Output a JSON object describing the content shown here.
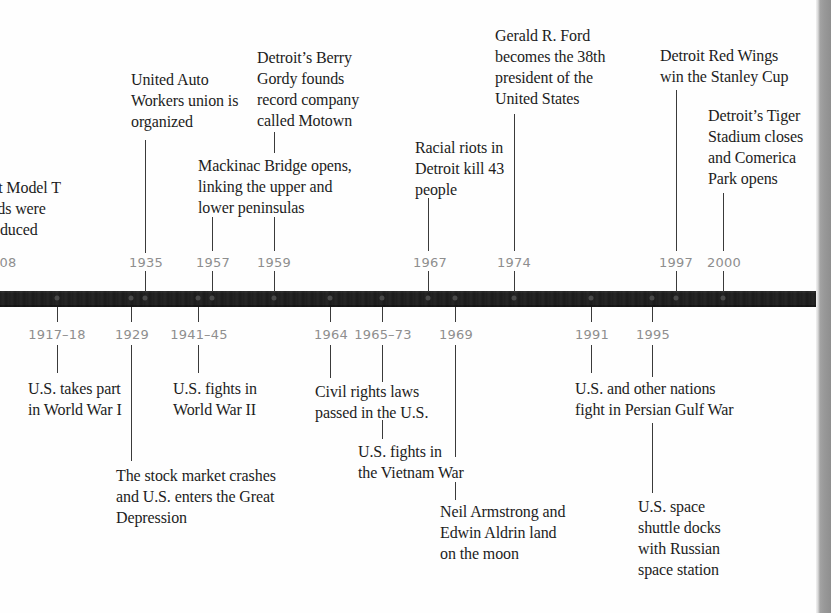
{
  "timeline": {
    "colors": {
      "bar": "#1e1e1e",
      "year_label": "#8e8e8e",
      "event_text": "#1c1c1c",
      "connector": "#3a3a3a",
      "edge_strip": "#999999"
    },
    "above": [
      {
        "year": "1908",
        "year_visible": "08",
        "text": "st Model T\nrds were\noduced",
        "text_full": "First Model T Fords were produced"
      },
      {
        "year": "1935",
        "text": "United Auto\nWorkers union is\norganized"
      },
      {
        "year": "1957",
        "text": "Mackinac Bridge opens,\nlinking the upper and\nlower peninsulas"
      },
      {
        "year": "1959",
        "text": "Detroit’s Berry\nGordy founds\nrecord company\ncalled Motown"
      },
      {
        "year": "1967",
        "text": "Racial riots in\nDetroit kill 43\npeople"
      },
      {
        "year": "1974",
        "text": "Gerald R. Ford\nbecomes the 38th\npresident of the\nUnited States"
      },
      {
        "year": "1997",
        "text": "Detroit Red Wings\nwin the Stanley Cup"
      },
      {
        "year": "2000",
        "text": "Detroit’s Tiger\nStadium closes\nand Comerica\nPark opens"
      }
    ],
    "below": [
      {
        "year": "1917–18",
        "text": "U.S. takes part\nin World War I"
      },
      {
        "year": "1929",
        "text": "The stock market crashes\nand U.S. enters the Great\nDepression"
      },
      {
        "year": "1941–45",
        "text": "U.S. fights in\nWorld War II"
      },
      {
        "year": "1964",
        "text": "Civil rights laws\npassed in the U.S."
      },
      {
        "year": "1965–73",
        "text": "U.S. fights in\nthe Vietnam War"
      },
      {
        "year": "1969",
        "text": "Neil Armstrong and\nEdwin Aldrin land\non the moon"
      },
      {
        "year": "1991",
        "text": "U.S. and other nations\nfight in Persian Gulf War"
      },
      {
        "year": "1995",
        "text": "U.S. space\nshuttle docks\nwith Russian\nspace station"
      }
    ]
  }
}
